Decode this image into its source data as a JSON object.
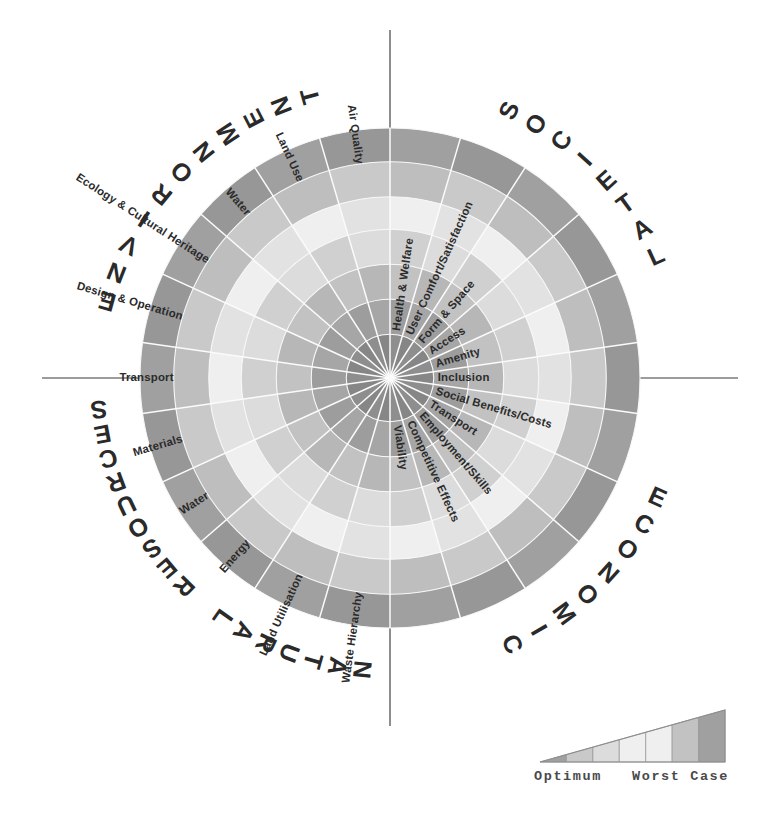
{
  "figure": {
    "kind": "radial-sustainability-wheel",
    "center": {
      "x": 390,
      "y": 378
    },
    "radius": 250,
    "ring_count": 7,
    "sector_count": 20
  },
  "quadrants": [
    {
      "id": "environment",
      "label": "ENVIRONMENT",
      "position": "top-left"
    },
    {
      "id": "societal",
      "label": "SOCIETAL",
      "position": "top-right"
    },
    {
      "id": "economic",
      "label": "ECONOMIC",
      "position": "bottom-right"
    },
    {
      "id": "natural-resources",
      "label": "NATURAL RESOURCES",
      "position": "bottom-left"
    }
  ],
  "sectors": [
    {
      "label": "Health & Welfare",
      "quadrant": "societal"
    },
    {
      "label": "User Comfort/Satisfaction",
      "quadrant": "societal"
    },
    {
      "label": "Form & Space",
      "quadrant": "societal"
    },
    {
      "label": "Access",
      "quadrant": "societal"
    },
    {
      "label": "Amenity",
      "quadrant": "societal"
    },
    {
      "label": "Inclusion",
      "quadrant": "societal"
    },
    {
      "label": "Social Benefits/Costs",
      "quadrant": "economic"
    },
    {
      "label": "Transport",
      "quadrant": "economic"
    },
    {
      "label": "Employment/Skills",
      "quadrant": "economic"
    },
    {
      "label": "Competitive Effects",
      "quadrant": "economic"
    },
    {
      "label": "Viability",
      "quadrant": "economic"
    },
    {
      "label": "Waste Hierarchy",
      "quadrant": "natural-resources"
    },
    {
      "label": "Land Utilisation",
      "quadrant": "natural-resources"
    },
    {
      "label": "Energy",
      "quadrant": "natural-resources"
    },
    {
      "label": "Water",
      "quadrant": "natural-resources"
    },
    {
      "label": "Materials",
      "quadrant": "natural-resources"
    },
    {
      "label": "Transport",
      "quadrant": "environment"
    },
    {
      "label": "Design & Operation",
      "quadrant": "environment"
    },
    {
      "label": "Ecology & Cultural Heritage",
      "quadrant": "environment"
    },
    {
      "label": "Water",
      "quadrant": "environment"
    },
    {
      "label": "Land Use",
      "quadrant": "environment"
    },
    {
      "label": "Air Quality",
      "quadrant": "environment"
    }
  ],
  "legend": {
    "optimum_label": "Optimum",
    "worst_case_label": "Worst Case",
    "band_count": 7
  },
  "colors": {
    "ring_1_core": "#8e8e8e",
    "ring_2": "#a6a6a6",
    "ring_3": "#c2c2c2",
    "ring_4": "#dcdcdc",
    "ring_5": "#efefef",
    "ring_6": "#c9c9c9",
    "ring_7_outer": "#a0a0a0",
    "alt_tint": "#b5b5b5",
    "background": "#ffffff",
    "axis": "#3a3a3a",
    "text": "#2b2b2b"
  },
  "chart_data": {
    "type": "pie",
    "title": "",
    "subtitle": "",
    "xlabel": "",
    "ylabel": "",
    "grid": true,
    "legend_position": "bottom-right",
    "radial_scale": {
      "inner_meaning": "Optimum",
      "outer_meaning": "Worst Case",
      "levels": 7,
      "level_labels": [
        "1",
        "2",
        "3",
        "4",
        "5",
        "6",
        "7"
      ]
    },
    "categories": [
      "Air Quality",
      "Land Use",
      "Water",
      "Ecology & Cultural Heritage",
      "Design & Operation",
      "Transport",
      "Materials",
      "Water",
      "Energy",
      "Land Utilisation",
      "Waste Hierarchy",
      "Viability",
      "Competitive Effects",
      "Employment/Skills",
      "Transport",
      "Social Benefits/Costs",
      "Inclusion",
      "Amenity",
      "Access",
      "Form & Space",
      "User Comfort/Satisfaction",
      "Health & Welfare"
    ],
    "groups": [
      {
        "name": "ENVIRONMENT",
        "members": [
          "Air Quality",
          "Land Use",
          "Water",
          "Ecology & Cultural Heritage",
          "Design & Operation",
          "Transport"
        ]
      },
      {
        "name": "NATURAL RESOURCES",
        "members": [
          "Materials",
          "Water",
          "Energy",
          "Land Utilisation",
          "Waste Hierarchy"
        ]
      },
      {
        "name": "ECONOMIC",
        "members": [
          "Viability",
          "Competitive Effects",
          "Employment/Skills",
          "Transport",
          "Social Benefits/Costs"
        ]
      },
      {
        "name": "SOCIETAL",
        "members": [
          "Inclusion",
          "Amenity",
          "Access",
          "Form & Space",
          "User Comfort/Satisfaction",
          "Health & Welfare"
        ]
      }
    ],
    "values": [
      7,
      7,
      7,
      7,
      7,
      7,
      7,
      7,
      7,
      7,
      7,
      7,
      7,
      7,
      7,
      7,
      7,
      7,
      7,
      7,
      7,
      7
    ],
    "annotations": [
      "Optimum",
      "Worst Case"
    ]
  }
}
